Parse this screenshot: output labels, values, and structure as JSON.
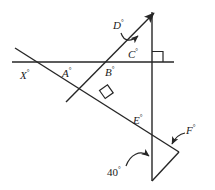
{
  "figure": {
    "type": "geometric-diagram",
    "stroke_color": "#262626",
    "background_color": "#ffffff",
    "width": 215,
    "height": 190
  },
  "labels": {
    "x_angle": "X",
    "a_angle": "A",
    "b_angle": "B",
    "c_angle": "C",
    "d_angle": "D",
    "e_angle": "E",
    "f_angle": "F",
    "known_angle": "40",
    "degree_symbol": "°"
  },
  "geometry": {
    "horizontal_line": {
      "x1": 12,
      "y1": 62,
      "x2": 174,
      "y2": 62
    },
    "vertical_line": {
      "x1": 152,
      "y1": 12,
      "x2": 152,
      "y2": 181
    },
    "diagonal_line": {
      "x1": 15,
      "y1": 48,
      "x2": 179,
      "y2": 152
    },
    "transversal_line": {
      "x1": 66,
      "y1": 102,
      "x2": 156,
      "y2": 11
    },
    "short_segment": {
      "x1": 179,
      "y1": 152,
      "x2": 152,
      "y2": 181
    },
    "right_angle_marks": [
      {
        "x": 104,
        "y": 92,
        "note": "diagonal meets transversal"
      },
      {
        "x": 155,
        "y": 50,
        "note": "horizontal meets vertical"
      }
    ],
    "arrow_markers": [
      {
        "name": "transversal-arrowhead",
        "x": 156,
        "y": 11
      },
      {
        "name": "d-angle-arrow",
        "x": 140,
        "y": 35
      },
      {
        "name": "f-angle-arrow",
        "x": 172,
        "y": 145
      },
      {
        "name": "forty-degree-arrow",
        "x": 150,
        "y": 158
      }
    ]
  }
}
